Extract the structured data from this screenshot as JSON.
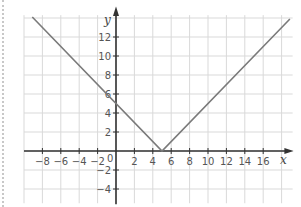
{
  "chart_data": {
    "type": "line",
    "title": "",
    "xlabel": "x",
    "ylabel": "y",
    "function": "y = |x - 5|",
    "xlim": [
      -10,
      19
    ],
    "ylim": [
      -5.5,
      15
    ],
    "grid": true,
    "x_ticks": [
      -8,
      -6,
      -4,
      -2,
      0,
      2,
      4,
      6,
      8,
      10,
      12,
      14,
      16
    ],
    "y_ticks": [
      -4,
      -2,
      2,
      4,
      6,
      8,
      10,
      12
    ],
    "series": [
      {
        "name": "y = |x - 5|",
        "color": "#7a7a7a",
        "x": [
          -9.1,
          5,
          18.9
        ],
        "y": [
          14.1,
          0,
          13.9
        ]
      }
    ],
    "vertex": [
      5,
      0
    ],
    "y_intercept": 5
  },
  "colors": {
    "grid": "#d9d9d9",
    "axis": "#333333",
    "line": "#7a7a7a"
  }
}
